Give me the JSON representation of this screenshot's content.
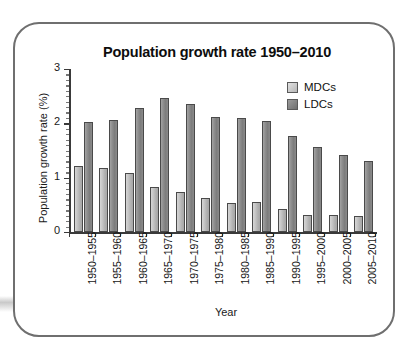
{
  "chart_data": {
    "type": "bar",
    "title": "Population growth rate 1950–2010",
    "xlabel": "Year",
    "ylabel": "Population growth rate (%)",
    "ylim": [
      0,
      3
    ],
    "yticks": [
      0,
      1,
      2,
      3
    ],
    "ytick_labels": [
      "0",
      "1",
      "2",
      "3"
    ],
    "grid": false,
    "legend_position": "top-right",
    "categories": [
      "1950–1955",
      "1955–1960",
      "1960–1965",
      "1965–1970",
      "1970–1975",
      "1975–1980",
      "1980–1985",
      "1985–1990",
      "1990–1995",
      "1995–2000",
      "2000–2005",
      "2005–2010"
    ],
    "series": [
      {
        "name": "MDCs",
        "color": "#c0c0c0",
        "values": [
          1.22,
          1.17,
          1.09,
          0.83,
          0.74,
          0.62,
          0.53,
          0.55,
          0.43,
          0.31,
          0.32,
          0.29
        ]
      },
      {
        "name": "LDCs",
        "color": "#878787",
        "values": [
          2.03,
          2.07,
          2.29,
          2.46,
          2.35,
          2.12,
          2.1,
          2.05,
          1.76,
          1.56,
          1.42,
          1.31
        ]
      }
    ]
  },
  "frame": {
    "border_color": "#6f6f6f"
  }
}
